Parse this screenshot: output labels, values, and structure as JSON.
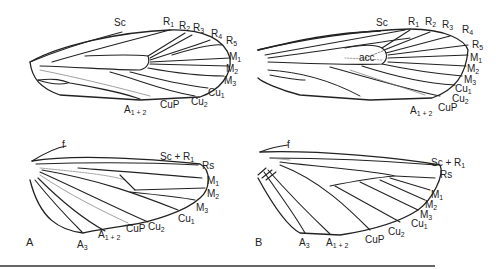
{
  "figure": {
    "panels": [
      {
        "id": "A",
        "label": "A"
      },
      {
        "id": "B",
        "label": "B"
      }
    ],
    "forewing_A": {
      "labels": [
        {
          "base": "Sc",
          "sub": "",
          "x": 114,
          "y": 18
        },
        {
          "base": "R",
          "sub": "1",
          "x": 163,
          "y": 17
        },
        {
          "base": "R",
          "sub": "2",
          "x": 179,
          "y": 21
        },
        {
          "base": "R",
          "sub": "3",
          "x": 193,
          "y": 23
        },
        {
          "base": "R",
          "sub": "4",
          "x": 211,
          "y": 29
        },
        {
          "base": "R",
          "sub": "5",
          "x": 226,
          "y": 36
        },
        {
          "base": "M",
          "sub": "1",
          "x": 229,
          "y": 52
        },
        {
          "base": "M",
          "sub": "2",
          "x": 226,
          "y": 64
        },
        {
          "base": "M",
          "sub": "3",
          "x": 224,
          "y": 76
        },
        {
          "base": "Cu",
          "sub": "1",
          "x": 208,
          "y": 88
        },
        {
          "base": "Cu",
          "sub": "2",
          "x": 191,
          "y": 97
        },
        {
          "base": "CuP",
          "sub": "",
          "x": 160,
          "y": 100
        },
        {
          "base": "A",
          "sub": "1 + 2",
          "x": 124,
          "y": 105
        }
      ]
    },
    "forewing_B": {
      "labels": [
        {
          "base": "Sc",
          "sub": "",
          "x": 376,
          "y": 18
        },
        {
          "base": "R",
          "sub": "1",
          "x": 408,
          "y": 17
        },
        {
          "base": "R",
          "sub": "2",
          "x": 425,
          "y": 17
        },
        {
          "base": "R",
          "sub": "3",
          "x": 442,
          "y": 20
        },
        {
          "base": "R",
          "sub": "4",
          "x": 462,
          "y": 25
        },
        {
          "base": "R",
          "sub": "5",
          "x": 472,
          "y": 40
        },
        {
          "base": "M",
          "sub": "1",
          "x": 470,
          "y": 53
        },
        {
          "base": "M",
          "sub": "2",
          "x": 467,
          "y": 64
        },
        {
          "base": "M",
          "sub": "3",
          "x": 464,
          "y": 75
        },
        {
          "base": "Cu",
          "sub": "1",
          "x": 455,
          "y": 84
        },
        {
          "base": "Cu",
          "sub": "2",
          "x": 452,
          "y": 94
        },
        {
          "base": "CuP",
          "sub": "",
          "x": 438,
          "y": 103
        },
        {
          "base": "A",
          "sub": "1 + 2",
          "x": 410,
          "y": 106
        },
        {
          "base": "acc",
          "sub": "",
          "x": 359,
          "y": 53
        }
      ]
    },
    "hindwing_A": {
      "labels": [
        {
          "base": "f",
          "sub": "",
          "x": 62,
          "y": 140
        },
        {
          "base": "Sc + R",
          "sub": "1",
          "x": 160,
          "y": 152
        },
        {
          "base": "Rs",
          "sub": "",
          "x": 202,
          "y": 161
        },
        {
          "base": "M",
          "sub": "1",
          "x": 207,
          "y": 176
        },
        {
          "base": "M",
          "sub": "2",
          "x": 207,
          "y": 189
        },
        {
          "base": "M",
          "sub": "3",
          "x": 196,
          "y": 203
        },
        {
          "base": "Cu",
          "sub": "1",
          "x": 178,
          "y": 214
        },
        {
          "base": "Cu",
          "sub": "2",
          "x": 148,
          "y": 222
        },
        {
          "base": "CuP",
          "sub": "",
          "x": 126,
          "y": 224
        },
        {
          "base": "A",
          "sub": "1 + 2",
          "x": 98,
          "y": 230
        },
        {
          "base": "A",
          "sub": "3",
          "x": 77,
          "y": 240
        }
      ]
    },
    "hindwing_B": {
      "labels": [
        {
          "base": "f",
          "sub": "",
          "x": 287,
          "y": 140
        },
        {
          "base": "Sc + R",
          "sub": "1",
          "x": 431,
          "y": 158
        },
        {
          "base": "Rs",
          "sub": "",
          "x": 440,
          "y": 170
        },
        {
          "base": "M",
          "sub": "1",
          "x": 431,
          "y": 190
        },
        {
          "base": "M",
          "sub": "2",
          "x": 425,
          "y": 200
        },
        {
          "base": "M",
          "sub": "3",
          "x": 420,
          "y": 210
        },
        {
          "base": "Cu",
          "sub": "1",
          "x": 411,
          "y": 219
        },
        {
          "base": "Cu",
          "sub": "2",
          "x": 388,
          "y": 227
        },
        {
          "base": "CuP",
          "sub": "",
          "x": 365,
          "y": 235
        },
        {
          "base": "A",
          "sub": "1 + 2",
          "x": 326,
          "y": 238
        },
        {
          "base": "A",
          "sub": "3",
          "x": 299,
          "y": 238
        }
      ]
    }
  }
}
